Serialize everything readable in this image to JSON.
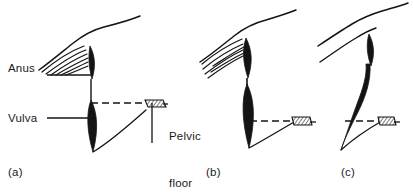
{
  "figure": {
    "background_color": "#ffffff",
    "ink_color": "#141414",
    "width": 413,
    "height": 192
  },
  "annotations": {
    "anus": "Anus",
    "vulva": "Vulva",
    "pelvic_floor_line1": "Pelvic",
    "pelvic_floor_line2": "floor"
  },
  "panels": [
    {
      "id": "a",
      "label": "(a)",
      "caption_position": "bottom-left",
      "has_anus_label": true,
      "has_vulva_label": true,
      "has_pelvic_floor_label": true,
      "pelvic_floor_level": "normal",
      "orifice_shapes": [
        "anal-canal",
        "vaginal-canal"
      ]
    },
    {
      "id": "b",
      "label": "(b)",
      "caption_position": "bottom-center",
      "has_anus_label": false,
      "has_vulva_label": false,
      "has_pelvic_floor_label": false,
      "pelvic_floor_level": "descended",
      "orifice_shapes": [
        "anal-canal",
        "vaginal-canal"
      ]
    },
    {
      "id": "c",
      "label": "(c)",
      "caption_position": "bottom-right",
      "has_anus_label": false,
      "has_vulva_label": false,
      "has_pelvic_floor_label": false,
      "pelvic_floor_level": "severely-descended",
      "orifice_shapes": [
        "anal-canal",
        "vaginal-canal-elongated"
      ]
    }
  ],
  "graphics": {
    "leader_lines": [
      "anus-leader",
      "vulva-leader",
      "pelvic-floor-leader"
    ],
    "dashed_lines": [
      "pelvic-floor-level-a",
      "pelvic-floor-level-b",
      "pelvic-floor-level-c"
    ],
    "hatched_markers": [
      "pelvic-floor-hatch-a",
      "pelvic-floor-hatch-b",
      "pelvic-floor-hatch-c"
    ],
    "fan_strokes": [
      "levator-fibers-a",
      "levator-fibers-b"
    ]
  }
}
